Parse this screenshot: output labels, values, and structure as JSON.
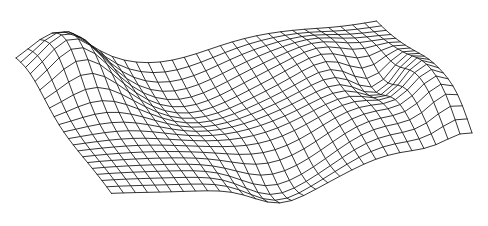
{
  "figure": {
    "title": "",
    "background_color": "#ffffff",
    "line_color": "#111111",
    "line_width": 0.85,
    "width": 488,
    "height": 226
  },
  "chart_data": {
    "type": "surface-wireframe",
    "title": "",
    "subtitle": "",
    "xlabel": "",
    "ylabel": "",
    "zlabel": "",
    "grid": true,
    "legend": "none",
    "axes_visible": false,
    "tick_labels": [],
    "annotations": [],
    "nx": 31,
    "ny": 21,
    "xlim": [
      0,
      30
    ],
    "ylim": [
      0,
      20
    ],
    "zlim": [
      -1.0,
      1.0
    ],
    "projection": {
      "type": "oblique",
      "origin_x": 22,
      "origin_y": 74,
      "col_step_x": 12.6,
      "col_step_y": -1.55,
      "row_step_x": 5.0,
      "row_step_y": 6.55,
      "z_scale": 42.0
    },
    "surface_model": {
      "note": "z = sum of gaussian bumps plus low-frequency ripple; evaluated on a 31x21 grid in (u,v) where u=col/30, v=row/20",
      "ripple": {
        "amp": 0.155,
        "ku": 6.5,
        "kv": 2.1,
        "phase": 0.55
      },
      "ripple2": {
        "amp": 0.085,
        "ku": 3.1,
        "kv": 5.4,
        "phase": 2.2
      },
      "tilt": {
        "du": 0.1,
        "dv": -0.06
      },
      "bumps": [
        {
          "name": "left-peak",
          "u": 0.115,
          "v": 0.14,
          "amp": 1.0,
          "su": 0.075,
          "sv": 0.16
        },
        {
          "name": "left-shoulder",
          "u": 0.205,
          "v": 0.3,
          "amp": 0.3,
          "su": 0.09,
          "sv": 0.18
        },
        {
          "name": "mid-trough",
          "u": 0.395,
          "v": 0.22,
          "amp": -0.52,
          "su": 0.15,
          "sv": 0.22
        },
        {
          "name": "back-swell",
          "u": 0.64,
          "v": 0.12,
          "amp": 0.46,
          "su": 0.15,
          "sv": 0.2
        },
        {
          "name": "right-ridge",
          "u": 0.805,
          "v": 0.33,
          "amp": 0.4,
          "su": 0.085,
          "sv": 0.17
        },
        {
          "name": "right-notch",
          "u": 0.875,
          "v": 0.46,
          "amp": -0.62,
          "su": 0.06,
          "sv": 0.13
        },
        {
          "name": "right-fold",
          "u": 0.965,
          "v": 0.6,
          "amp": 0.78,
          "su": 0.055,
          "sv": 0.2
        },
        {
          "name": "front-dip",
          "u": 0.56,
          "v": 0.86,
          "amp": -0.58,
          "su": 0.12,
          "sv": 0.16
        },
        {
          "name": "front-step",
          "u": 0.46,
          "v": 0.95,
          "amp": -0.34,
          "su": 0.07,
          "sv": 0.12
        },
        {
          "name": "front-rise",
          "u": 0.76,
          "v": 0.78,
          "amp": 0.34,
          "su": 0.13,
          "sv": 0.18
        },
        {
          "name": "far-right-lip",
          "u": 1.0,
          "v": 0.88,
          "amp": 0.55,
          "su": 0.06,
          "sv": 0.14
        }
      ]
    }
  }
}
